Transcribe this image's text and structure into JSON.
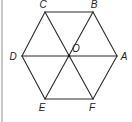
{
  "diagram": {
    "type": "regular-hexagon",
    "colors": {
      "stroke": "#2a2a2a",
      "label": "#222222",
      "border": "#c8c8c8",
      "background": "#ffffff"
    },
    "vertices": [
      {
        "id": "A",
        "label": "A",
        "x": 117,
        "y": 56,
        "label_x": 124,
        "label_y": 60
      },
      {
        "id": "B",
        "label": "B",
        "x": 93,
        "y": 12,
        "label_x": 94,
        "label_y": 8
      },
      {
        "id": "C",
        "label": "C",
        "x": 45,
        "y": 12,
        "label_x": 43,
        "label_y": 8
      },
      {
        "id": "D",
        "label": "D",
        "x": 22,
        "y": 56,
        "label_x": 13,
        "label_y": 60
      },
      {
        "id": "E",
        "label": "E",
        "x": 45,
        "y": 99,
        "label_x": 42,
        "label_y": 111
      },
      {
        "id": "F",
        "label": "F",
        "x": 93,
        "y": 99,
        "label_x": 92,
        "label_y": 111
      }
    ],
    "center": {
      "id": "O",
      "label": "O",
      "x": 69,
      "y": 56,
      "label_x": 76,
      "label_y": 52
    },
    "edges": [
      {
        "from": "A",
        "to": "B"
      },
      {
        "from": "B",
        "to": "C"
      },
      {
        "from": "C",
        "to": "D"
      },
      {
        "from": "D",
        "to": "E"
      },
      {
        "from": "E",
        "to": "F"
      },
      {
        "from": "F",
        "to": "A"
      }
    ],
    "diagonals": [
      {
        "from": "A",
        "to": "D"
      },
      {
        "from": "B",
        "to": "E"
      },
      {
        "from": "C",
        "to": "F"
      }
    ]
  }
}
